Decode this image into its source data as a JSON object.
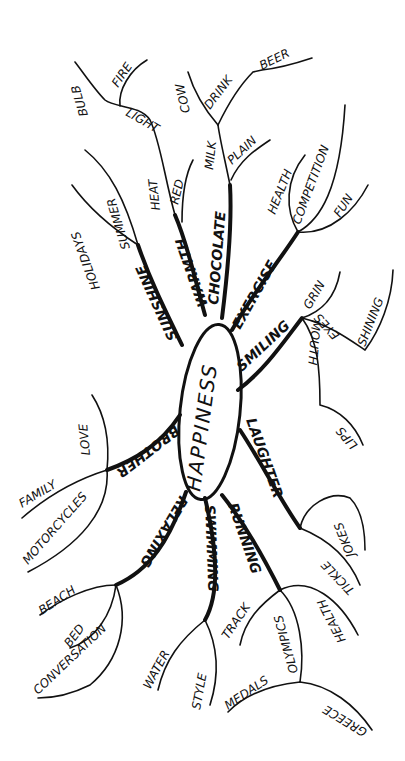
{
  "center": {
    "label": "HAPPINESS"
  },
  "branches": [
    {
      "label": "SUNSHINE",
      "children": [
        "HOLIDAYS",
        "SUMMER"
      ]
    },
    {
      "label": "WARMTH",
      "children": [
        "HEAT",
        "LIGHT",
        "BULB",
        "FIRE",
        "RED"
      ]
    },
    {
      "label": "CHOCOLATE",
      "children": [
        "MILK",
        "COW",
        "DRINK",
        "BEER",
        "PLAIN"
      ]
    },
    {
      "label": "EXERCISE",
      "children": [
        "HEALTH",
        "COMPETITION",
        "FUN"
      ]
    },
    {
      "label": "SMILING",
      "children": [
        "GRIN",
        "MOUTH",
        "LIPS",
        "EYES",
        "SHINING"
      ]
    },
    {
      "label": "LAUGHTER",
      "children": [
        "JOKES",
        "TICKLE"
      ]
    },
    {
      "label": "RUNNING",
      "children": [
        "TRACK",
        "OLYMPICS",
        "MEDALS",
        "GREECE",
        "HEALTH"
      ]
    },
    {
      "label": "SWIMMING",
      "children": [
        "WATER",
        "STYLE"
      ]
    },
    {
      "label": "RELAXING",
      "children": [
        "BEACH",
        "BED",
        "CONVERSATION"
      ]
    },
    {
      "label": "BROTHER",
      "children": [
        "FAMILY",
        "LOVE",
        "MOTORCYCLES"
      ]
    }
  ]
}
